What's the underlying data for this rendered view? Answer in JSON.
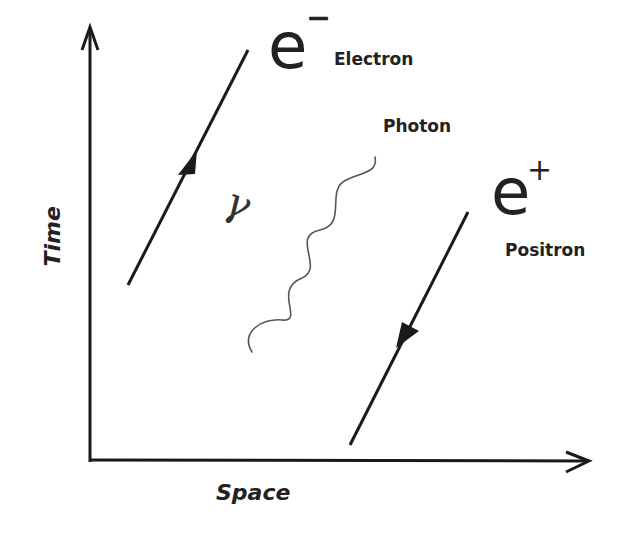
{
  "diagram": {
    "type": "feynman-diagram",
    "axes": {
      "x_label": "Space",
      "y_label": "Time"
    },
    "particles": {
      "electron": {
        "symbol": "e",
        "charge": "−",
        "name": "Electron",
        "arrow_direction": "forward-in-time"
      },
      "positron": {
        "symbol": "e",
        "charge": "+",
        "name": "Positron",
        "arrow_direction": "backward-in-time"
      },
      "photon": {
        "symbol": "γ",
        "name": "Photon",
        "line_style": "wavy"
      }
    },
    "colors": {
      "line": "#1a1a1a",
      "photon": "#555555",
      "text": "#222222",
      "background": "#ffffff"
    }
  }
}
